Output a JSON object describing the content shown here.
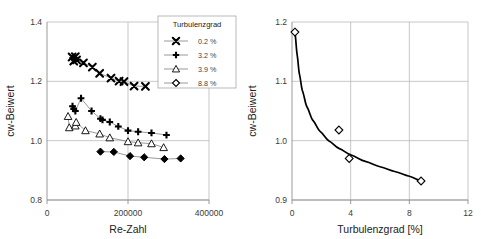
{
  "chart_data": [
    {
      "id": "left",
      "type": "scatter",
      "title": "",
      "xlabel": "Re-Zahl",
      "ylabel": "cw-Beiwert",
      "xlim": [
        0,
        400000
      ],
      "ylim": [
        0.8,
        1.4
      ],
      "xticks": [
        0,
        200000,
        400000
      ],
      "xticklabels": [
        "0",
        "200000",
        "400000"
      ],
      "yticks": [
        0.8,
        1.0,
        1.2,
        1.4
      ],
      "yticklabels": [
        "0.8",
        "1.0",
        "1.2",
        "1.4"
      ],
      "grid": true,
      "legend": {
        "title": "Turbulenzgrad",
        "position": "upper-right",
        "entries": [
          {
            "label": "0.2 %",
            "marker": "cross-x"
          },
          {
            "label": "3.2 %",
            "marker": "plus"
          },
          {
            "label": "3.9 %",
            "marker": "triangle-open"
          },
          {
            "label": "8.8 %",
            "marker": "diamond-open"
          }
        ]
      },
      "series": [
        {
          "name": "0.2 %",
          "marker": "cross-x",
          "points": [
            [
              62000,
              1.282
            ],
            [
              66000,
              1.268
            ],
            [
              70000,
              1.283
            ],
            [
              73000,
              1.272
            ],
            [
              90000,
              1.262
            ],
            [
              112000,
              1.248
            ],
            [
              130000,
              1.227
            ],
            [
              158000,
              1.211
            ],
            [
              178000,
              1.201
            ],
            [
              190000,
              1.199
            ],
            [
              215000,
              1.184
            ],
            [
              243000,
              1.183
            ]
          ]
        },
        {
          "name": "3.2 %",
          "marker": "plus",
          "points": [
            [
              63000,
              1.116
            ],
            [
              66000,
              1.107
            ],
            [
              70000,
              1.1
            ],
            [
              84000,
              1.143
            ],
            [
              110000,
              1.1
            ],
            [
              132000,
              1.074
            ],
            [
              137000,
              1.07
            ],
            [
              155000,
              1.063
            ],
            [
              176000,
              1.048
            ],
            [
              200000,
              1.034
            ],
            [
              225000,
              1.03
            ],
            [
              258000,
              1.026
            ],
            [
              295000,
              1.019
            ]
          ]
        },
        {
          "name": "3.9 %",
          "marker": "triangle-open",
          "points": [
            [
              52000,
              1.082
            ],
            [
              55000,
              1.044
            ],
            [
              70000,
              1.05
            ],
            [
              72000,
              1.062
            ],
            [
              95000,
              1.034
            ],
            [
              130000,
              1.023
            ],
            [
              155000,
              1.01
            ],
            [
              200000,
              0.997
            ],
            [
              225000,
              0.993
            ],
            [
              258000,
              0.99
            ],
            [
              288000,
              0.977
            ]
          ]
        },
        {
          "name": "8.8 %",
          "marker": "diamond-filled",
          "points": [
            [
              132000,
              0.963
            ],
            [
              165000,
              0.962
            ],
            [
              205000,
              0.948
            ],
            [
              240000,
              0.944
            ],
            [
              290000,
              0.938
            ],
            [
              330000,
              0.94
            ]
          ]
        }
      ]
    },
    {
      "id": "right",
      "type": "scatter",
      "title": "",
      "xlabel": "Turbulenzgrad [%]",
      "ylabel": "cw-Beiwert",
      "xlim": [
        0,
        12
      ],
      "ylim": [
        0.9,
        1.2
      ],
      "xticks": [
        0,
        4,
        8,
        12
      ],
      "xticklabels": [
        "0",
        "4",
        "8",
        "12"
      ],
      "yticks": [
        0.9,
        1.0,
        1.1,
        1.2
      ],
      "yticklabels": [
        "0.9",
        "1.0",
        "1.1",
        "1.2"
      ],
      "grid": true,
      "series": [
        {
          "name": "cw vs Turbulenzgrad",
          "marker": "diamond-open",
          "points": [
            [
              0.2,
              1.183
            ],
            [
              3.2,
              1.018
            ],
            [
              3.9,
              0.97
            ],
            [
              8.8,
              0.932
            ]
          ]
        }
      ],
      "fit_curve": {
        "name": "trend",
        "points": [
          [
            0.2,
            1.183
          ],
          [
            0.35,
            1.145
          ],
          [
            0.5,
            1.113
          ],
          [
            0.7,
            1.085
          ],
          [
            1.0,
            1.058
          ],
          [
            1.4,
            1.035
          ],
          [
            1.9,
            1.016
          ],
          [
            2.5,
            1.0
          ],
          [
            3.2,
            0.987
          ],
          [
            4.0,
            0.976
          ],
          [
            5.0,
            0.965
          ],
          [
            6.0,
            0.956
          ],
          [
            7.0,
            0.948
          ],
          [
            8.0,
            0.94
          ],
          [
            8.8,
            0.932
          ]
        ]
      }
    }
  ],
  "colors": {
    "background": "#ffffff",
    "grid": "#b9b9b9",
    "axis": "#8f8f8f",
    "marker": "#000000",
    "connector": "#6f6f6f",
    "text": "#333333"
  }
}
